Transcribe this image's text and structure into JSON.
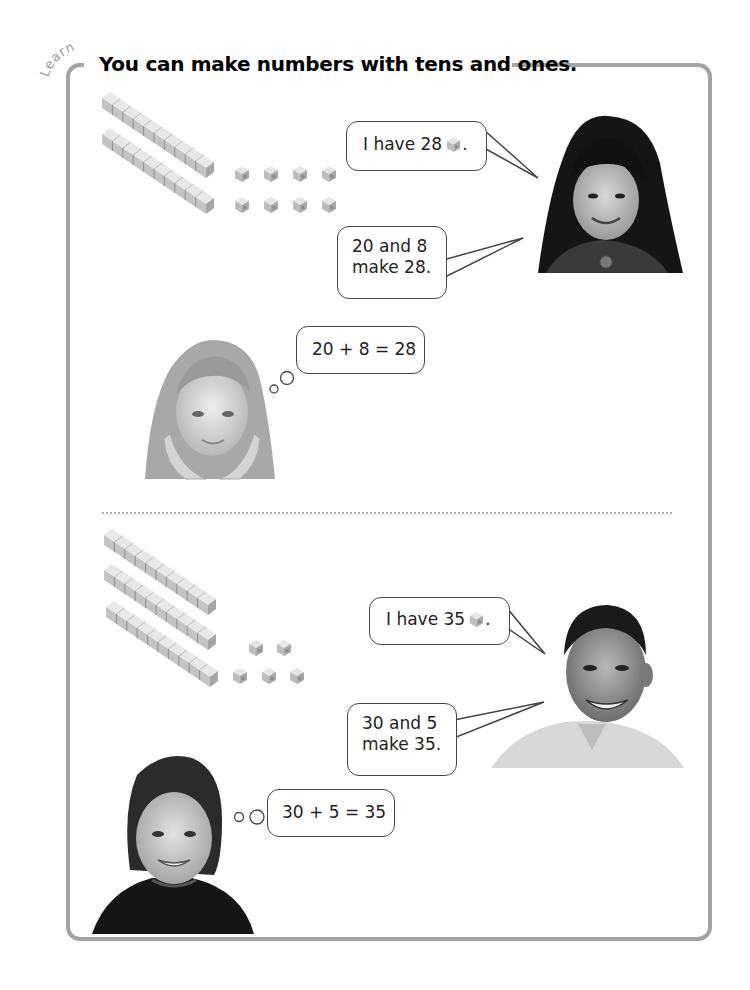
{
  "tag": "Learn",
  "title": "You can make numbers with tens and ones.",
  "section1": {
    "tens_rods": 2,
    "ones_cubes": 8,
    "girl_speech_1": {
      "prefix": "I have 28",
      "suffix": ".",
      "icon": "unit-cube-icon"
    },
    "girl_speech_2": {
      "line1": "20 and 8",
      "line2": "make 28."
    },
    "thought": "20 + 8 = 28"
  },
  "section2": {
    "tens_rods": 3,
    "ones_cubes": 5,
    "boy_speech_1": {
      "prefix": "I have 35",
      "suffix": ".",
      "icon": "unit-cube-icon"
    },
    "boy_speech_2": {
      "line1": "30 and 5",
      "line2": "make 35."
    },
    "thought": "30 + 5 = 35"
  },
  "colors": {
    "frame": "#a3a3a3",
    "text": "#111111",
    "bubble_border": "#444444",
    "cube": "#c8c8c8"
  }
}
